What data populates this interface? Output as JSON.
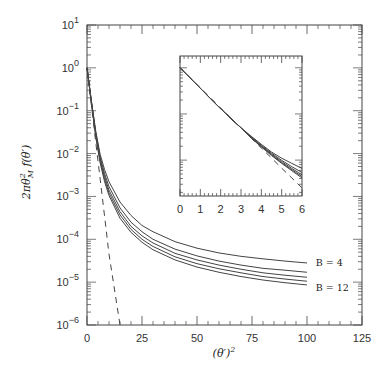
{
  "chart_data": [
    {
      "type": "line",
      "title": "",
      "xlabel": "(θ′)²",
      "ylabel": "2πθ²_M f(θ′)",
      "xscale": "linear",
      "yscale": "log",
      "xlim": [
        0,
        125
      ],
      "ylim": [
        1e-06,
        10
      ],
      "xticks": [
        0,
        25,
        50,
        75,
        100,
        125
      ],
      "xtick_labels": [
        "0",
        "25",
        "50",
        "75",
        "100",
        "125"
      ],
      "yticks": [
        1e-06,
        1e-05,
        0.0001,
        0.001,
        0.01,
        0.1,
        1,
        10
      ],
      "ytick_labels": [
        {
          "base": "10",
          "exp": "−6"
        },
        {
          "base": "10",
          "exp": "−5"
        },
        {
          "base": "10",
          "exp": "−4"
        },
        {
          "base": "10",
          "exp": "−3"
        },
        {
          "base": "10",
          "exp": "−2"
        },
        {
          "base": "10",
          "exp": "−1"
        },
        {
          "base": "10",
          "exp": "0"
        },
        {
          "base": "10",
          "exp": "1"
        }
      ],
      "grid": false,
      "legend": null,
      "annotations": [
        {
          "text": "B = 4",
          "x": 104,
          "y": 2.9e-05
        },
        {
          "text": "B = 12",
          "x": 104,
          "y": 7.5e-06
        }
      ],
      "x": [
        0,
        2,
        4,
        6,
        8,
        10,
        15,
        20,
        25,
        30,
        40,
        50,
        60,
        70,
        80,
        90,
        100
      ],
      "series": [
        {
          "name": "B = 4",
          "style": "solid",
          "values": [
            1.0,
            0.17,
            0.033,
            0.0095,
            0.0042,
            0.0022,
            0.00074,
            0.00036,
            0.00021,
            0.00015,
            8.8e-05,
            6.2e-05,
            4.8e-05,
            4e-05,
            3.5e-05,
            3.1e-05,
            2.8e-05
          ]
        },
        {
          "name": "B = 6",
          "style": "solid",
          "values": [
            1.0,
            0.165,
            0.03,
            0.0082,
            0.0034,
            0.0017,
            0.00054,
            0.00025,
            0.00015,
            0.0001,
            5.9e-05,
            4.1e-05,
            3.1e-05,
            2.5e-05,
            2.1e-05,
            1.9e-05,
            1.7e-05
          ]
        },
        {
          "name": "B = 8",
          "style": "solid",
          "values": [
            1.0,
            0.16,
            0.028,
            0.0074,
            0.0029,
            0.0014,
            0.00044,
            0.0002,
            0.00012,
            8.2e-05,
            4.7e-05,
            3.3e-05,
            2.5e-05,
            2e-05,
            1.65e-05,
            1.45e-05,
            1.3e-05
          ]
        },
        {
          "name": "B = 10",
          "style": "solid",
          "values": [
            1.0,
            0.155,
            0.026,
            0.0067,
            0.0025,
            0.0012,
            0.00037,
            0.00017,
            0.0001,
            6.8e-05,
            3.9e-05,
            2.7e-05,
            2.05e-05,
            1.65e-05,
            1.35e-05,
            1.18e-05,
            1.05e-05
          ]
        },
        {
          "name": "B = 12",
          "style": "solid",
          "values": [
            1.0,
            0.15,
            0.024,
            0.006,
            0.0022,
            0.00105,
            0.00031,
            0.000145,
            8.5e-05,
            5.7e-05,
            3.3e-05,
            2.25e-05,
            1.7e-05,
            1.35e-05,
            1.12e-05,
            9.7e-06,
            8.6e-06
          ]
        },
        {
          "name": "exp(-θ′²)",
          "style": "dashed",
          "values": [
            1.0,
            0.135,
            0.018,
            0.0025,
            0.00034,
            4.5e-05,
            1e-06,
            null,
            null,
            null,
            null,
            null,
            null,
            null,
            null,
            null,
            null
          ]
        }
      ]
    },
    {
      "type": "line",
      "title": "",
      "role": "inset",
      "xlabel": "",
      "ylabel": "",
      "xscale": "linear",
      "yscale": "log",
      "xlim": [
        0,
        6
      ],
      "ylim": [
        0.00167,
        1.8
      ],
      "xticks": [
        0,
        1,
        2,
        3,
        4,
        5,
        6
      ],
      "xtick_labels": [
        "0",
        "1",
        "2",
        "3",
        "4",
        "5",
        "6"
      ],
      "grid": false,
      "x": [
        0,
        0.5,
        1,
        1.5,
        2,
        2.5,
        3,
        3.5,
        4,
        4.5,
        5,
        5.5,
        6
      ],
      "series": [
        {
          "name": "B = 4",
          "style": "solid",
          "values": [
            1.0,
            0.6,
            0.36,
            0.215,
            0.13,
            0.08,
            0.05,
            0.033,
            0.022,
            0.015,
            0.011,
            0.0085,
            0.0066
          ]
        },
        {
          "name": "B = 6",
          "style": "solid",
          "values": [
            1.0,
            0.6,
            0.36,
            0.215,
            0.13,
            0.08,
            0.05,
            0.032,
            0.021,
            0.0142,
            0.0099,
            0.0072,
            0.0054
          ]
        },
        {
          "name": "B = 8",
          "style": "solid",
          "values": [
            1.0,
            0.6,
            0.36,
            0.215,
            0.13,
            0.08,
            0.05,
            0.031,
            0.0202,
            0.0135,
            0.0093,
            0.0066,
            0.0048
          ]
        },
        {
          "name": "B = 10",
          "style": "solid",
          "values": [
            1.0,
            0.6,
            0.36,
            0.215,
            0.13,
            0.08,
            0.05,
            0.0305,
            0.0197,
            0.013,
            0.0088,
            0.0062,
            0.0044
          ]
        },
        {
          "name": "B = 12",
          "style": "solid",
          "values": [
            1.0,
            0.6,
            0.36,
            0.215,
            0.13,
            0.08,
            0.05,
            0.03,
            0.0193,
            0.0126,
            0.0085,
            0.0059,
            0.0041
          ]
        },
        {
          "name": "exp(-θ′²)",
          "style": "dashed",
          "values": [
            1.0,
            0.607,
            0.368,
            0.223,
            0.135,
            0.082,
            0.0498,
            0.0302,
            0.0183,
            0.0111,
            0.0067,
            0.0041,
            0.0025
          ]
        }
      ]
    }
  ]
}
